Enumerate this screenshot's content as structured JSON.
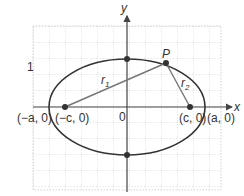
{
  "diagram": {
    "axes": {
      "x_label": "x",
      "y_label": "y",
      "origin_label": "0"
    },
    "points": {
      "P": "P",
      "left_vertex": "(−a, 0)",
      "left_focus": "(−c, 0)",
      "right_focus": "(c, 0)",
      "right_vertex": "(a, 0)"
    },
    "segments": {
      "r1": "r",
      "r1_sub": "1",
      "r2": "r",
      "r2_sub": "2"
    },
    "side_mark": "1",
    "colors": {
      "curve": "#333333",
      "segment": "#777777",
      "grid": "#c8c8c8",
      "axis": "#444444",
      "dot": "#333333"
    }
  }
}
